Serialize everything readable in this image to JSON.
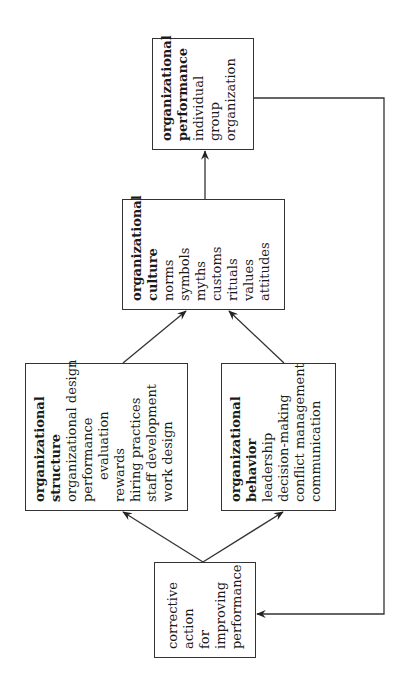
{
  "diagram": {
    "orientation": "rotated 90 degrees counter-clockwise",
    "nodes": {
      "performance": {
        "title_lines": [
          "organizational",
          "performance"
        ],
        "items": [
          "individual",
          "group",
          "organization"
        ]
      },
      "culture": {
        "title_lines": [
          "organizational",
          "culture"
        ],
        "items": [
          "norms",
          "symbols",
          "myths",
          "customs",
          "rituals",
          "values",
          "attitudes"
        ]
      },
      "structure": {
        "title_lines": [
          "organizational",
          "structure"
        ],
        "items": [
          "organizational design",
          "performance",
          "evaluation",
          "rewards",
          "hiring practices",
          "staff development",
          "work design"
        ]
      },
      "behavior": {
        "title_lines": [
          "organizational",
          "behavior"
        ],
        "items": [
          "leadership",
          "decision-making",
          "conflict management",
          "communication"
        ]
      },
      "corrective": {
        "title_lines": [],
        "items": [
          "corrective",
          "action",
          "for",
          "improving",
          "performance"
        ]
      }
    },
    "edges": [
      {
        "from": "corrective",
        "to": "structure"
      },
      {
        "from": "corrective",
        "to": "behavior"
      },
      {
        "from": "structure",
        "to": "culture"
      },
      {
        "from": "behavior",
        "to": "culture"
      },
      {
        "from": "culture",
        "to": "performance"
      },
      {
        "from": "performance",
        "to": "corrective",
        "type": "feedback"
      }
    ],
    "colors": {
      "line": "#333333",
      "text": "#1a1a1a",
      "background": "#ffffff"
    }
  }
}
